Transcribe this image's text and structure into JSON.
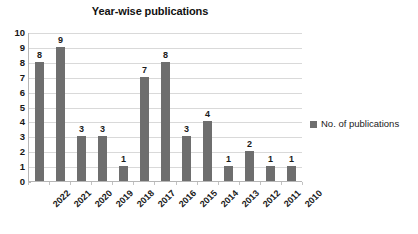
{
  "chart_data": {
    "type": "bar",
    "title": "Year-wise publications",
    "xlabel": "",
    "ylabel": "",
    "categories": [
      "2022",
      "2021",
      "2020",
      "2019",
      "2018",
      "2017",
      "2016",
      "2015",
      "2014",
      "2013",
      "2012",
      "2011",
      "2010"
    ],
    "values": [
      8,
      9,
      3,
      3,
      1,
      7,
      8,
      3,
      4,
      1,
      2,
      1,
      1
    ],
    "series": [
      {
        "name": "No. of publications",
        "values": [
          8,
          9,
          3,
          3,
          1,
          7,
          8,
          3,
          4,
          1,
          2,
          1,
          1
        ],
        "color": "#6e6e6e"
      }
    ],
    "ylim": [
      0,
      10
    ],
    "ytick_step": 1,
    "ytick_labels": [
      "10",
      "9",
      "8",
      "7",
      "6",
      "5",
      "4",
      "3",
      "2",
      "1",
      "0"
    ],
    "data_labels": [
      "8",
      "9",
      "3",
      "3",
      "1",
      "7",
      "8",
      "3",
      "4",
      "1",
      "2",
      "1",
      "1"
    ],
    "grid": true,
    "grid_axis": "y",
    "grid_color": "#d9d9d9",
    "legend": {
      "position": "right",
      "entries": [
        {
          "label": "No. of publications",
          "color": "#6e6e6e"
        }
      ]
    },
    "axis_color": "#b6b6b6",
    "background": "#ffffff",
    "xtick_rotation": -45
  }
}
